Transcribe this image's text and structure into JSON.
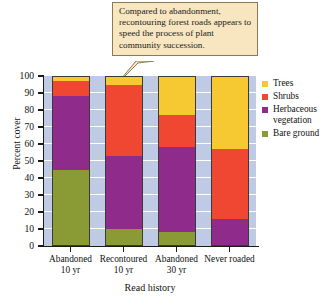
{
  "callout": {
    "text": "Compared to abandonment, recontouring forest roads appears to speed the process of plant community succession."
  },
  "legend": {
    "position": "right",
    "items": [
      {
        "label": "Trees",
        "color": "#f6c832"
      },
      {
        "label": "Shrubs",
        "color": "#f04733"
      },
      {
        "label": "Herbaceous vegetation",
        "color": "#8f2c8b"
      },
      {
        "label": "Bare ground",
        "color": "#8a9a35"
      }
    ]
  },
  "axes": {
    "ylabel": "Percent cover",
    "xlabel": "Read history",
    "yticks": [
      "100",
      "90",
      "80",
      "70",
      "60",
      "50",
      "40",
      "30",
      "20",
      "10",
      "0"
    ]
  },
  "chart_data": {
    "type": "bar",
    "subtype": "stacked-percent",
    "title": "",
    "xlabel": "Read history",
    "ylabel": "Percent cover",
    "ylim": [
      0,
      100
    ],
    "grid": true,
    "legend_position": "right",
    "plot_background": "#bfcbe4",
    "categories": [
      "Abandoned 10 yr",
      "Recontoured 10 yr",
      "Abandoned 30 yr",
      "Never roaded"
    ],
    "category_lines": [
      [
        "Abandoned",
        "10 yr"
      ],
      [
        "Recontoured",
        "10 yr"
      ],
      [
        "Abandoned",
        "30 yr"
      ],
      [
        "Never roaded",
        ""
      ]
    ],
    "series": [
      {
        "name": "Bare ground",
        "color": "#8a9a35",
        "values": [
          45,
          10,
          8,
          0
        ]
      },
      {
        "name": "Herbaceous vegetation",
        "color": "#8f2c8b",
        "values": [
          43,
          43,
          50,
          16
        ]
      },
      {
        "name": "Shrubs",
        "color": "#f04733",
        "values": [
          9,
          42,
          19,
          41
        ]
      },
      {
        "name": "Trees",
        "color": "#f6c832",
        "values": [
          3,
          5,
          23,
          43
        ]
      }
    ],
    "stack_order_bottom_to_top": [
      "Bare ground",
      "Herbaceous vegetation",
      "Shrubs",
      "Trees"
    ],
    "cumulative_tops": [
      [
        45,
        88,
        97,
        100
      ],
      [
        10,
        53,
        95,
        100
      ],
      [
        8,
        58,
        77,
        100
      ],
      [
        0,
        16,
        57,
        100
      ]
    ]
  }
}
